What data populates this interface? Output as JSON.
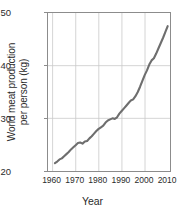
{
  "chart_data": {
    "type": "line",
    "title": "",
    "xlabel": "Year",
    "ylabel": "World meat production per person (kg)",
    "ylabel_line1": "World meat production",
    "ylabel_line2": "per person (kg)",
    "xlim": [
      1958,
      2011
    ],
    "ylim": [
      20,
      50
    ],
    "xticks": [
      1960,
      1970,
      1980,
      1990,
      2000,
      2010
    ],
    "yticks": [
      20,
      30,
      40,
      50
    ],
    "grid": true,
    "legend": null,
    "series": [
      {
        "name": "World meat production per person",
        "color": "#6e6e6e",
        "x": [
          1961,
          1962,
          1963,
          1964,
          1965,
          1966,
          1967,
          1968,
          1969,
          1970,
          1971,
          1972,
          1973,
          1974,
          1975,
          1976,
          1977,
          1978,
          1979,
          1980,
          1981,
          1982,
          1983,
          1984,
          1985,
          1986,
          1987,
          1988,
          1989,
          1990,
          1991,
          1992,
          1993,
          1994,
          1995,
          1996,
          1997,
          1998,
          1999,
          2000,
          2001,
          2002,
          2003,
          2004,
          2005,
          2006,
          2007,
          2008,
          2009,
          2010
        ],
        "values": [
          21.5,
          21.8,
          22.2,
          22.4,
          22.8,
          23.2,
          23.6,
          24.1,
          24.5,
          24.9,
          25.3,
          25.4,
          25.2,
          25.6,
          25.7,
          26.2,
          26.6,
          27.1,
          27.6,
          28.0,
          28.3,
          28.6,
          29.2,
          29.6,
          29.8,
          30.0,
          29.9,
          30.2,
          30.9,
          31.4,
          31.9,
          32.4,
          32.9,
          33.4,
          33.6,
          34.2,
          35.0,
          36.0,
          37.1,
          38.2,
          39.1,
          40.2,
          41.0,
          41.4,
          42.3,
          43.3,
          44.3,
          45.3,
          46.4,
          47.5
        ]
      }
    ]
  }
}
